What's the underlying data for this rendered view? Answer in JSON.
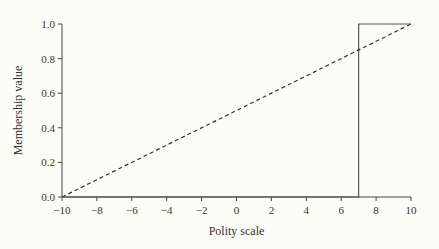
{
  "chart_data": {
    "type": "line",
    "title": "",
    "xlabel": "Polity scale",
    "ylabel": "Membership value",
    "xlim": [
      -10,
      10
    ],
    "ylim": [
      0,
      1
    ],
    "xticks": [
      -10,
      -8,
      -6,
      -4,
      -2,
      0,
      2,
      4,
      6,
      8,
      10
    ],
    "xtick_labels": [
      "−10",
      "−8",
      "−6",
      "−4",
      "−2",
      "0",
      "2",
      "4",
      "6",
      "8",
      "10"
    ],
    "yticks": [
      0.0,
      0.2,
      0.4,
      0.6,
      0.8,
      1.0
    ],
    "ytick_labels": [
      "0.0",
      "0.2",
      "0.4",
      "0.6",
      "0.8",
      "1.0"
    ],
    "grid": false,
    "legend": null,
    "series": [
      {
        "name": "crisp step membership",
        "style": "solid",
        "color": "#555555",
        "x": [
          -10,
          7,
          7,
          10
        ],
        "y": [
          0,
          0,
          1,
          1
        ]
      },
      {
        "name": "linear membership",
        "style": "dashed",
        "color": "#333333",
        "x": [
          -10,
          10
        ],
        "y": [
          0,
          1
        ]
      },
      {
        "name": "baseline shading",
        "style": "solid",
        "color_start": "#6a6a9a",
        "color_end": "#6b7a2e",
        "x": [
          -10,
          7
        ],
        "y": [
          0,
          0
        ]
      }
    ]
  }
}
